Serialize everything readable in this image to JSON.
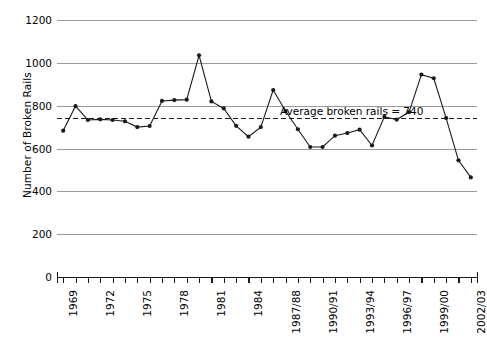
{
  "chart_data": {
    "type": "line",
    "title": "",
    "xlabel": "",
    "ylabel": "Number of Broken Rails",
    "ylim": [
      0,
      1200
    ],
    "yticks": [
      0,
      200,
      400,
      600,
      800,
      1000,
      1200
    ],
    "grid": "horizontal",
    "legend": "none",
    "categories": [
      "1969",
      "1970",
      "1971",
      "1972",
      "1973",
      "1974",
      "1975",
      "1976",
      "1977",
      "1978",
      "1979",
      "1980",
      "1981",
      "1982",
      "1983",
      "1984",
      "1985",
      "1986",
      "1987/88",
      "1988/89",
      "1989/90",
      "1990/91",
      "1991/92",
      "1992/93",
      "1993/94",
      "1994/95",
      "1995/96",
      "1996/97",
      "1997/98",
      "1998/99",
      "1999/00",
      "2000/01",
      "2001/02",
      "2002/03"
    ],
    "tick_labels_shown": [
      "1969",
      "1972",
      "1975",
      "1978",
      "1981",
      "1984",
      "1987/88",
      "1990/91",
      "1993/94",
      "1996/97",
      "1999/00",
      "2002/03"
    ],
    "values": [
      683,
      798,
      733,
      736,
      733,
      727,
      700,
      705,
      822,
      826,
      828,
      1035,
      820,
      787,
      706,
      655,
      700,
      873,
      775,
      690,
      607,
      607,
      660,
      672,
      688,
      614,
      748,
      735,
      770,
      945,
      928,
      742,
      545,
      465
    ],
    "annotations": [
      {
        "name": "average-line",
        "text": "Average broken rails = 740",
        "value": 740,
        "style": "dashed"
      }
    ],
    "colors": {
      "line": "#1a1a1a",
      "marker": "#1a1a1a",
      "grid": "#9b9b9b",
      "axis": "#1a1a1a",
      "background": "#ffffff"
    }
  }
}
